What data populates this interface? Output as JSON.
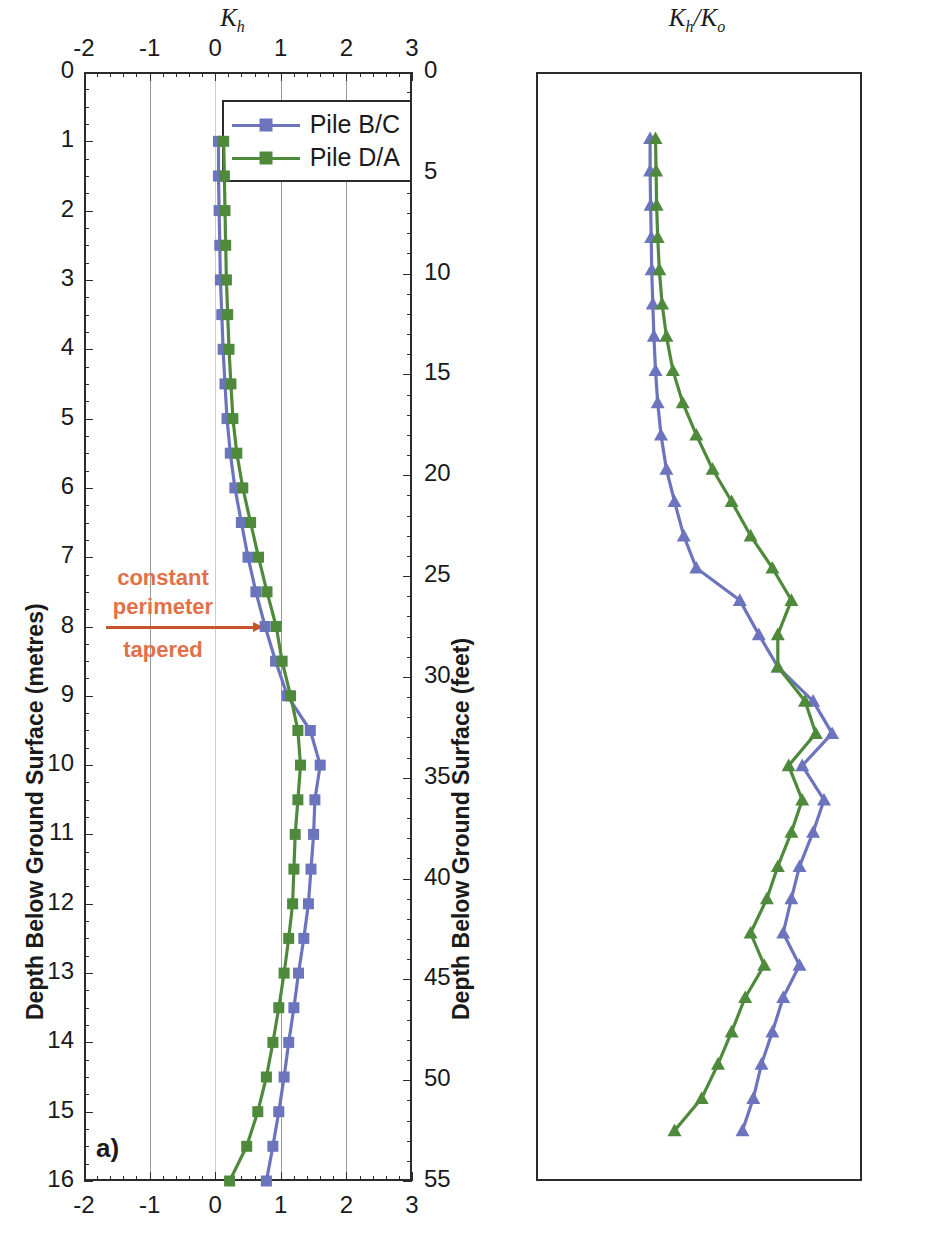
{
  "figure": {
    "panels": [
      {
        "id": "a",
        "panel_label": "a)",
        "axis_title": "K",
        "axis_title_sub": "h",
        "legend": [
          {
            "label": "Pile B/C",
            "color": "#6B74BD",
            "marker": "square"
          },
          {
            "label": "Pile D/A",
            "color": "#4F8A3C",
            "marker": "square"
          }
        ],
        "annotation": {
          "above": "constant\nperimeter",
          "above_line1": "constant",
          "above_line2": "perimeter",
          "below": "tapered",
          "depth_m": 8,
          "color": "#E0714A"
        },
        "left_axis_label": "Depth Below Ground Surface (metres)",
        "right_axis_label": "Depth Below Ground Surface (feet)",
        "x_ticks": [
          "-2",
          "-1",
          "0",
          "1",
          "2",
          "3"
        ],
        "y_left_ticks": [
          "0",
          "1",
          "2",
          "3",
          "4",
          "5",
          "6",
          "7",
          "8",
          "9",
          "10",
          "11",
          "12",
          "13",
          "14",
          "15",
          "16"
        ],
        "y_right_ticks": [
          "0",
          "5",
          "10",
          "15",
          "20",
          "25",
          "30",
          "35",
          "40",
          "45",
          "50",
          "55"
        ]
      },
      {
        "id": "b",
        "panel_label": "b)",
        "axis_title": "K",
        "axis_title_sub": "h",
        "axis_title_2": "K",
        "axis_title_sub_2": "o",
        "legend": [
          {
            "label": "Pile B/C",
            "color": "#6B74BD",
            "marker": "triangle"
          },
          {
            "label": "Pile D/A",
            "color": "#4F8A3C",
            "marker": "triangle"
          }
        ],
        "annotation": {
          "above_line1": "constant",
          "above_line2": "perimeter",
          "below": "tapered",
          "depth_ft": 26.2,
          "color": "#E0714A"
        },
        "left_axis_label": "Depth Below Ground Surface (feet)",
        "right_axis_label": "Depth Below Ground Surface (metres)",
        "x_ticks": [
          "-2",
          "-1",
          "0",
          "1",
          "2",
          "3",
          "4"
        ],
        "y_left_ticks": [
          "0",
          "5",
          "10",
          "15",
          "20",
          "25",
          "30",
          "35",
          "40",
          "45",
          "50",
          "55"
        ],
        "y_right_ticks": [
          "0",
          "1",
          "2",
          "3",
          "4",
          "5",
          "6",
          "7",
          "8",
          "9",
          "10",
          "11",
          "12",
          "13",
          "14",
          "15",
          "16"
        ]
      }
    ]
  },
  "chart_data": [
    {
      "type": "line",
      "title": "Kh",
      "xlabel": "K_h",
      "ylabel": "Depth Below Ground Surface (metres)",
      "ylabel_secondary": "Depth Below Ground Surface (feet)",
      "xlim": [
        -2,
        3
      ],
      "ylim": [
        0,
        16
      ],
      "ylim_secondary": [
        0,
        55
      ],
      "y_inverted": true,
      "grid": true,
      "legend_position": "top-right",
      "panel_label": "a)",
      "annotation_depth_m": 8,
      "series": [
        {
          "name": "Pile B/C",
          "color": "#6B74BD",
          "marker": "square",
          "depth_m": [
            1.0,
            1.5,
            2.0,
            2.5,
            3.0,
            3.5,
            4.0,
            4.5,
            5.0,
            5.5,
            6.0,
            6.5,
            7.0,
            7.5,
            8.0,
            8.5,
            9.0,
            9.5,
            10.0,
            10.5,
            11.0,
            11.5,
            12.0,
            12.5,
            13.0,
            13.5,
            14.0,
            14.5,
            15.0,
            15.5,
            16.0
          ],
          "values": [
            0.05,
            0.05,
            0.06,
            0.07,
            0.08,
            0.1,
            0.12,
            0.15,
            0.18,
            0.23,
            0.3,
            0.4,
            0.5,
            0.62,
            0.76,
            0.92,
            1.1,
            1.45,
            1.6,
            1.52,
            1.5,
            1.46,
            1.42,
            1.35,
            1.27,
            1.2,
            1.12,
            1.05,
            0.97,
            0.88,
            0.78
          ]
        },
        {
          "name": "Pile D/A",
          "color": "#4F8A3C",
          "marker": "square",
          "depth_m": [
            1.0,
            1.5,
            2.0,
            2.5,
            3.0,
            3.5,
            4.0,
            4.5,
            5.0,
            5.5,
            6.0,
            6.5,
            7.0,
            7.5,
            8.0,
            8.5,
            9.0,
            9.5,
            10.0,
            10.5,
            11.0,
            11.5,
            12.0,
            12.5,
            13.0,
            13.5,
            14.0,
            14.5,
            15.0,
            15.5,
            16.0
          ],
          "values": [
            0.13,
            0.14,
            0.15,
            0.16,
            0.17,
            0.19,
            0.21,
            0.24,
            0.27,
            0.33,
            0.42,
            0.54,
            0.66,
            0.79,
            0.93,
            1.02,
            1.15,
            1.26,
            1.3,
            1.26,
            1.22,
            1.2,
            1.18,
            1.12,
            1.05,
            0.97,
            0.88,
            0.78,
            0.65,
            0.48,
            0.22
          ]
        }
      ]
    },
    {
      "type": "line",
      "title": "Kh/Ko",
      "xlabel": "K_h/K_o",
      "ylabel": "Depth Below Ground Surface (feet)",
      "ylabel_secondary": "Depth Below Ground Surface (metres)",
      "xlim": [
        -2,
        4
      ],
      "ylim": [
        0,
        55
      ],
      "ylim_secondary": [
        0,
        16
      ],
      "y_inverted": true,
      "grid": true,
      "legend_position": "top-right",
      "panel_label": "b)",
      "annotation_depth_ft": 26.2,
      "series": [
        {
          "name": "Pile B/C",
          "color": "#6B74BD",
          "marker": "triangle",
          "depth_ft": [
            3.3,
            4.9,
            6.6,
            8.2,
            9.8,
            11.5,
            13.1,
            14.8,
            16.4,
            18.0,
            19.7,
            21.3,
            23.0,
            24.6,
            26.2,
            27.9,
            29.5,
            31.2,
            32.8,
            34.4,
            36.1,
            37.7,
            39.4,
            41.0,
            42.7,
            44.3,
            45.9,
            47.6,
            49.2,
            50.9,
            52.5
          ],
          "values": [
            0.1,
            0.1,
            0.11,
            0.12,
            0.13,
            0.15,
            0.17,
            0.2,
            0.24,
            0.3,
            0.4,
            0.55,
            0.72,
            0.95,
            1.75,
            2.1,
            2.45,
            3.1,
            3.45,
            2.9,
            3.3,
            3.1,
            2.85,
            2.7,
            2.55,
            2.85,
            2.55,
            2.35,
            2.15,
            2.0,
            1.8
          ]
        },
        {
          "name": "Pile D/A",
          "color": "#4F8A3C",
          "marker": "triangle",
          "depth_ft": [
            3.3,
            4.9,
            6.6,
            8.2,
            9.8,
            11.5,
            13.1,
            14.8,
            16.4,
            18.0,
            19.7,
            21.3,
            23.0,
            24.6,
            26.2,
            27.9,
            29.5,
            31.2,
            32.8,
            34.4,
            36.1,
            37.7,
            39.4,
            41.0,
            42.7,
            44.3,
            45.9,
            47.6,
            49.2,
            50.9,
            52.5
          ],
          "values": [
            0.2,
            0.21,
            0.22,
            0.24,
            0.27,
            0.32,
            0.4,
            0.52,
            0.7,
            0.95,
            1.25,
            1.6,
            1.95,
            2.35,
            2.7,
            2.45,
            2.45,
            2.95,
            3.15,
            2.65,
            2.9,
            2.7,
            2.45,
            2.25,
            1.95,
            2.2,
            1.85,
            1.6,
            1.35,
            1.05,
            0.55
          ]
        }
      ]
    }
  ]
}
